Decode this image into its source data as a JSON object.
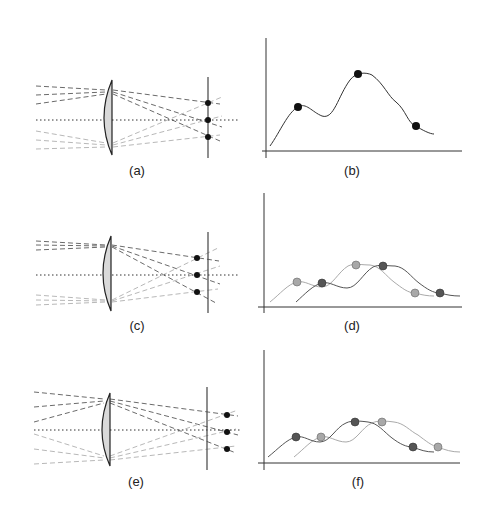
{
  "panels": [
    {
      "id": "a",
      "label": "(a)",
      "type": "optics",
      "focus": "on-screen"
    },
    {
      "id": "b",
      "label": "(b)",
      "type": "intensity-profile",
      "curves": 1
    },
    {
      "id": "c",
      "label": "(c)",
      "type": "optics",
      "focus": "before-screen"
    },
    {
      "id": "d",
      "label": "(d)",
      "type": "intensity-profile",
      "curves": 2
    },
    {
      "id": "e",
      "label": "(e)",
      "type": "optics",
      "focus": "behind-screen"
    },
    {
      "id": "f",
      "label": "(f)",
      "type": "intensity-profile",
      "curves": 2
    }
  ],
  "colors": {
    "dark_ray": "#6b6b6b",
    "light_ray": "#b8b8b8",
    "lens_fill": "#d9d9d9",
    "dark_curve": "#555555",
    "light_curve": "#aaaaaa",
    "dark_dot": "#555555",
    "light_dot": "#a8a8a8",
    "axis": "#333333"
  }
}
